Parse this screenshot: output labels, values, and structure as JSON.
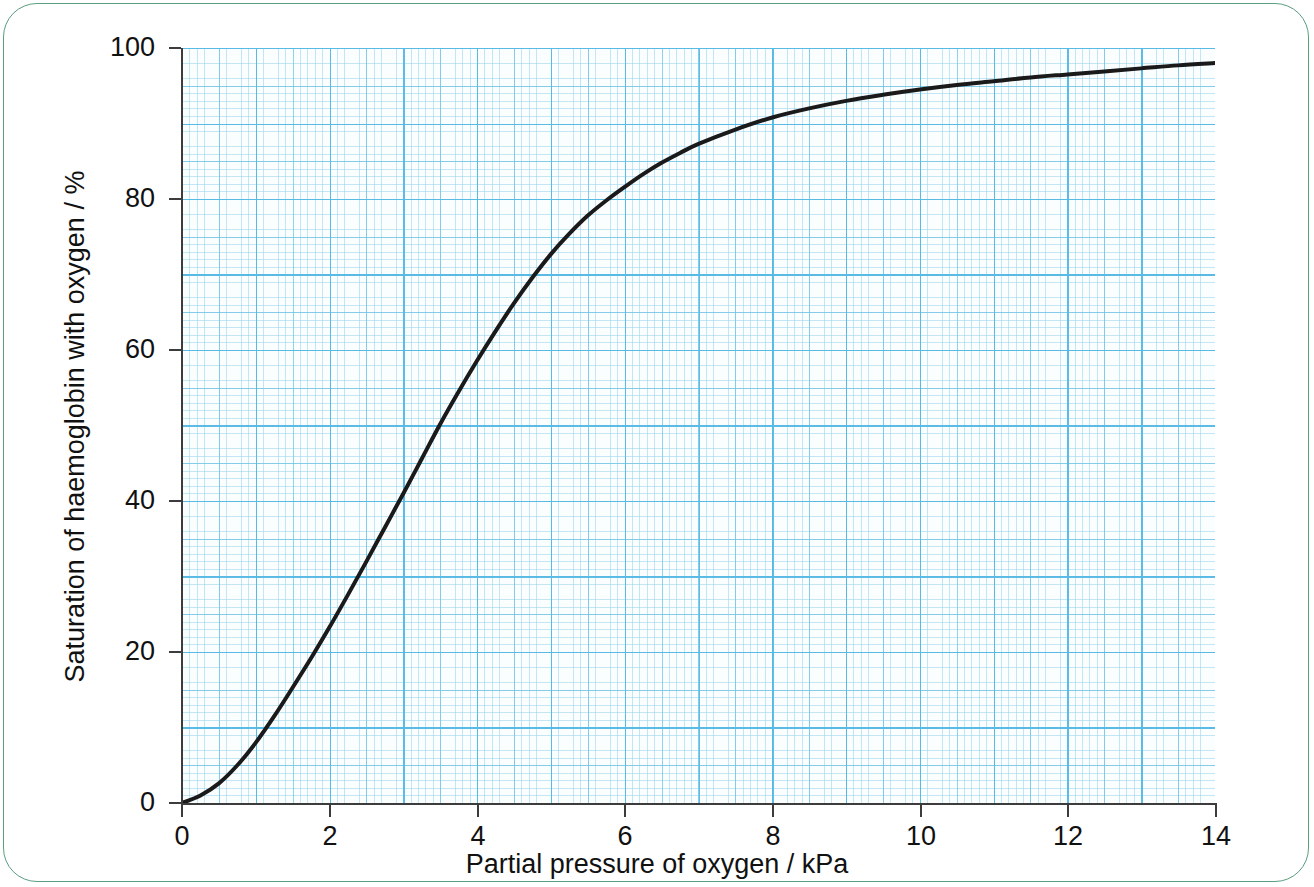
{
  "frame": {
    "border_color": "#5b9e7e"
  },
  "chart_data": {
    "type": "line",
    "title": "",
    "xlabel": "Partial pressure of oxygen / kPa",
    "ylabel": "Saturation of haemoglobin with oxygen / %",
    "xlim": [
      0,
      14
    ],
    "ylim": [
      0,
      100
    ],
    "xticks": [
      "0",
      "2",
      "4",
      "6",
      "8",
      "10",
      "12",
      "14"
    ],
    "xtick_values": [
      0,
      2,
      4,
      6,
      8,
      10,
      12,
      14
    ],
    "yticks": [
      "0",
      "20",
      "40",
      "60",
      "80",
      "100"
    ],
    "ytick_values": [
      0,
      20,
      40,
      60,
      80,
      100
    ],
    "grid": "graph-paper",
    "grid_color": "#56bae4",
    "grid_major_step_x": 1,
    "grid_major_step_y": 10,
    "legend": "none",
    "line_color": "#1a1a1a",
    "line_width": 4,
    "series": [
      {
        "name": "Oxygen dissociation curve",
        "x": [
          0,
          0.25,
          0.5,
          0.75,
          1.0,
          1.25,
          1.5,
          1.75,
          2.0,
          2.25,
          2.5,
          2.75,
          3.0,
          3.25,
          3.5,
          3.75,
          4.0,
          4.25,
          4.5,
          4.75,
          5.0,
          5.25,
          5.5,
          5.75,
          6.0,
          6.25,
          6.5,
          6.75,
          7.0,
          7.5,
          8.0,
          8.5,
          9.0,
          9.5,
          10.0,
          10.5,
          11.0,
          11.5,
          12.0,
          12.5,
          13.0,
          13.5,
          14.0
        ],
        "y": [
          0,
          1.0,
          2.6,
          5.0,
          8.0,
          11.5,
          15.3,
          19.2,
          23.3,
          27.6,
          32.0,
          36.5,
          41.0,
          45.6,
          50.2,
          54.5,
          58.6,
          62.5,
          66.2,
          69.6,
          72.7,
          75.4,
          77.8,
          79.8,
          81.6,
          83.3,
          84.8,
          86.1,
          87.3,
          89.2,
          90.8,
          92.0,
          93.0,
          93.8,
          94.5,
          95.1,
          95.6,
          96.1,
          96.5,
          96.9,
          97.3,
          97.7,
          98.0
        ]
      }
    ]
  }
}
